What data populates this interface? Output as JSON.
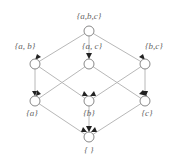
{
  "diagram": {
    "type": "hasse-diagram",
    "colors": {
      "edge": "#b8b8b8",
      "node_stroke": "#7a7a7a",
      "arrow": "#222222",
      "label": "#666666"
    },
    "nodes": [
      {
        "id": "abc",
        "label": "{a,b,c}",
        "x": 89,
        "y": 31
      },
      {
        "id": "ab",
        "label": "{a, b}",
        "x": 35,
        "y": 64
      },
      {
        "id": "ac",
        "label": "{a, c}",
        "x": 89,
        "y": 64
      },
      {
        "id": "bc",
        "label": "{b,c}",
        "x": 145,
        "y": 64
      },
      {
        "id": "a",
        "label": "{a}",
        "x": 35,
        "y": 101
      },
      {
        "id": "b",
        "label": "{b}",
        "x": 89,
        "y": 101
      },
      {
        "id": "c",
        "label": "{c}",
        "x": 145,
        "y": 101
      },
      {
        "id": "empty",
        "label": "{ }",
        "x": 89,
        "y": 137
      }
    ],
    "edges": [
      [
        "abc",
        "ab"
      ],
      [
        "abc",
        "ac"
      ],
      [
        "abc",
        "bc"
      ],
      [
        "ab",
        "a"
      ],
      [
        "ab",
        "b"
      ],
      [
        "ac",
        "a"
      ],
      [
        "ac",
        "c"
      ],
      [
        "bc",
        "b"
      ],
      [
        "bc",
        "c"
      ],
      [
        "a",
        "empty"
      ],
      [
        "b",
        "empty"
      ],
      [
        "c",
        "empty"
      ]
    ]
  }
}
